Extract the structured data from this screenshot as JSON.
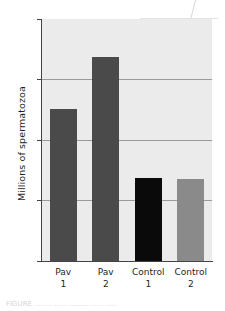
{
  "chart_data": {
    "type": "bar",
    "title": "",
    "xlabel": "",
    "ylabel": "Millions of spermatozoa",
    "categories": [
      "Pav 1",
      "Pav 2",
      "Control 1",
      "Control 2"
    ],
    "category_lines": [
      {
        "line1": "Pav",
        "line2": "1"
      },
      {
        "line1": "Pav",
        "line2": "2"
      },
      {
        "line1": "Control",
        "line2": "1"
      },
      {
        "line1": "Control",
        "line2": "2"
      }
    ],
    "values": [
      12.6,
      16.9,
      6.9,
      6.8
    ],
    "bar_colors": [
      "#4a4a4a",
      "#4a4a4a",
      "#0a0a0a",
      "#8a8a8a"
    ],
    "ylim": [
      0,
      20
    ],
    "yticks": [
      0,
      5,
      10,
      15,
      20
    ],
    "ytick_labels": [
      "0",
      "5",
      "10",
      "15",
      "20"
    ],
    "grid": true,
    "grid_axis": "y",
    "legend": "none",
    "plot_background": "#ebebeb",
    "axis_color": "#444444"
  },
  "figure": {
    "caption_partial": "FIGURE  ........  ......  ........  ......  ....."
  }
}
